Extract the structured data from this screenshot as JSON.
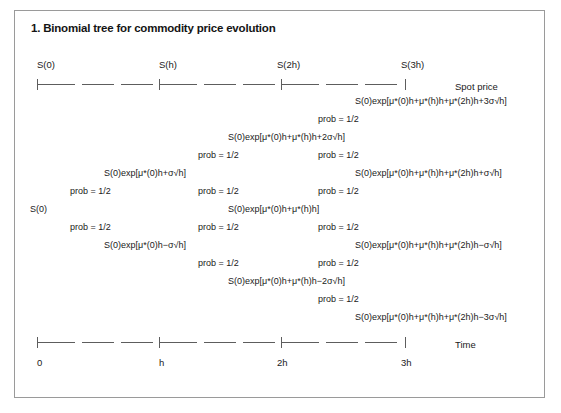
{
  "figure": {
    "title": "1. Binomial tree for commodity price evolution"
  },
  "top_axis": {
    "caption": "Spot price",
    "stage_labels": [
      "S(0)",
      "S(h)",
      "S(2h)",
      "S(3h)"
    ]
  },
  "bottom_axis": {
    "caption": "Time",
    "scale_labels": [
      "0",
      "h",
      "2h",
      "3h"
    ]
  },
  "tree": {
    "prob_label": "prob = 1/2",
    "nodes": [
      {
        "text": "S(0)exp[μ*(0)h+μ*(h)h+μ*(2h)h+3σ√h]",
        "x": 355,
        "y": 96
      },
      {
        "text": "S(0)exp[μ*(0)h+μ*(h)h+2σ√h]",
        "x": 228,
        "y": 132
      },
      {
        "text": "S(0)exp[μ*(0)h+μ*(h)h+μ*(2h)h+σ√h]",
        "x": 355,
        "y": 168
      },
      {
        "text": "S(0)exp[μ*(0)h+σ√h]",
        "x": 104,
        "y": 168
      },
      {
        "text": "S(0)exp[μ*(0)h+μ*(h)h]",
        "x": 228,
        "y": 204
      },
      {
        "text": "S(0)",
        "x": 30,
        "y": 204
      },
      {
        "text": "S(0)exp[μ*(0)h−σ√h]",
        "x": 104,
        "y": 240
      },
      {
        "text": "S(0)exp[μ*(0)h+μ*(h)h+μ*(2h)h−σ√h]",
        "x": 355,
        "y": 240
      },
      {
        "text": "S(0)exp[μ*(0)h+μ*(h)h−2σ√h]",
        "x": 228,
        "y": 276
      },
      {
        "text": "S(0)exp[μ*(0)h+μ*(h)h+μ*(2h)h−3σ√h]",
        "x": 355,
        "y": 312
      }
    ],
    "probs": [
      {
        "x": 318,
        "y": 114
      },
      {
        "x": 198,
        "y": 150
      },
      {
        "x": 318,
        "y": 150
      },
      {
        "x": 70,
        "y": 186
      },
      {
        "x": 198,
        "y": 186
      },
      {
        "x": 318,
        "y": 186
      },
      {
        "x": 70,
        "y": 222
      },
      {
        "x": 198,
        "y": 222
      },
      {
        "x": 318,
        "y": 222
      },
      {
        "x": 198,
        "y": 258
      },
      {
        "x": 318,
        "y": 258
      },
      {
        "x": 318,
        "y": 294
      }
    ]
  }
}
